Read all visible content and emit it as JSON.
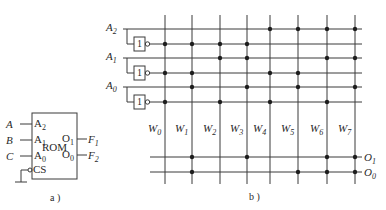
{
  "figure_a": {
    "caption": "a )",
    "block_label": "ROM",
    "inputs": [
      {
        "signal": "A",
        "pin": "A",
        "pin_sub": "2"
      },
      {
        "signal": "B",
        "pin": "A",
        "pin_sub": "1"
      },
      {
        "signal": "C",
        "pin": "A",
        "pin_sub": "0"
      }
    ],
    "outputs": [
      {
        "pin": "O",
        "pin_sub": "1",
        "signal": "F",
        "signal_sub": "1"
      },
      {
        "pin": "O",
        "pin_sub": "0",
        "signal": "F",
        "signal_sub": "2"
      }
    ],
    "chip_select": "CS"
  },
  "figure_b": {
    "caption": "b )",
    "address_inputs": [
      {
        "name": "A",
        "sub": "2"
      },
      {
        "name": "A",
        "sub": "1"
      },
      {
        "name": "A",
        "sub": "0"
      }
    ],
    "inverter_label": "1",
    "word_lines": [
      {
        "name": "W",
        "sub": "0"
      },
      {
        "name": "W",
        "sub": "1"
      },
      {
        "name": "W",
        "sub": "2"
      },
      {
        "name": "W",
        "sub": "3"
      },
      {
        "name": "W",
        "sub": "4"
      },
      {
        "name": "W",
        "sub": "5"
      },
      {
        "name": "W",
        "sub": "6"
      },
      {
        "name": "W",
        "sub": "7"
      }
    ],
    "outputs": [
      {
        "name": "O",
        "sub": "1"
      },
      {
        "name": "O",
        "sub": "0"
      }
    ],
    "decoder_rows": [
      {
        "line": "A2",
        "dots": [
          4,
          5,
          6,
          7
        ]
      },
      {
        "line": "A2'",
        "dots": [
          0,
          1,
          2,
          3
        ]
      },
      {
        "line": "A1",
        "dots": [
          2,
          3,
          6,
          7
        ]
      },
      {
        "line": "A1'",
        "dots": [
          0,
          1,
          4,
          5
        ]
      },
      {
        "line": "A0",
        "dots": [
          1,
          3,
          5,
          7
        ]
      },
      {
        "line": "A0'",
        "dots": [
          0,
          2,
          4,
          6
        ]
      }
    ],
    "output_rows": [
      {
        "line": "O1",
        "dots": [
          1,
          3,
          6,
          7
        ]
      },
      {
        "line": "O0",
        "dots": [
          1,
          5,
          6,
          7
        ]
      }
    ]
  }
}
